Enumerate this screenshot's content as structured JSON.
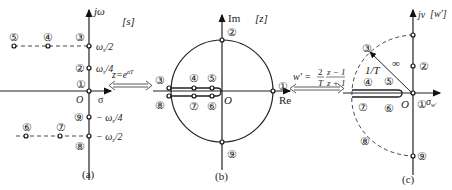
{
  "panel_a": {
    "caption": "(a)",
    "plane_label": "[s]",
    "y_axis_label": "jω",
    "x_axis_label": "σ",
    "origin_label": "O",
    "ticks": {
      "w_half": "ω s/2",
      "w_quarter": "ω s/4",
      "neg_w_quarter": "− ω s/4",
      "neg_w_half": "− ω s/2"
    },
    "points": [
      "①",
      "②",
      "③",
      "④",
      "⑤",
      "⑥",
      "⑦",
      "⑧",
      "⑨"
    ]
  },
  "mapping_1": {
    "formula": "z=e^σT",
    "lhs": "z=e",
    "exp": "σT"
  },
  "panel_b": {
    "caption": "(b)",
    "plane_label": "[z]",
    "y_axis_label": "Im",
    "x_axis_label": "Re",
    "origin_label": "O",
    "points": [
      "①",
      "②",
      "③",
      "④",
      "⑤",
      "⑥",
      "⑦",
      "⑧",
      "⑨"
    ]
  },
  "mapping_2": {
    "formula": "w' = (2/T)(z−1)/(z+1)",
    "lhs": "w' =",
    "num_a": "2",
    "den_a": "T",
    "num_b": "z − 1",
    "den_b": "z + 1"
  },
  "panel_c": {
    "caption": "(c)",
    "plane_label": "[w']",
    "y_axis_label": "jv",
    "x_axis_label": "σ",
    "x_axis_sub": "w'",
    "origin_label": "O",
    "radius_label": "1/T",
    "infinity_label": "∞",
    "points": [
      "①",
      "②",
      "③",
      "④",
      "⑤",
      "⑥",
      "⑦",
      "⑧",
      "⑨"
    ]
  }
}
